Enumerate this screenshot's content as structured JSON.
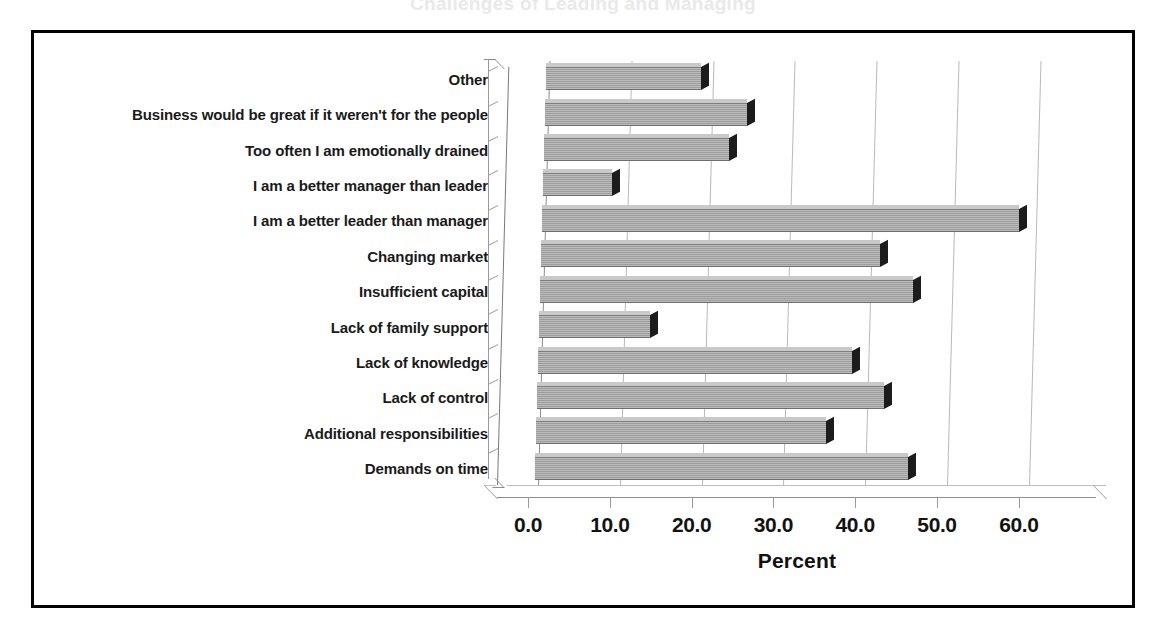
{
  "figure": {
    "frame_border_color": "#000000",
    "background": "#ffffff",
    "title_remnant": "Challenges of Leading and Managing"
  },
  "chart_data": {
    "type": "bar",
    "orientation": "horizontal",
    "title": "",
    "xlabel": "Percent",
    "ylabel": "",
    "xlim": [
      0.0,
      60.0
    ],
    "xticks": [
      "0.0",
      "10.0",
      "20.0",
      "30.0",
      "40.0",
      "50.0",
      "60.0"
    ],
    "xtick_values": [
      0,
      10,
      20,
      30,
      40,
      50,
      60
    ],
    "grid": true,
    "grid_axis": "x",
    "legend": false,
    "bar_color": "#9d9d9d",
    "bar_edge_color": "#1c1c1c",
    "style": "3d-bar",
    "categories": [
      "Other",
      "Business would be great if it weren't for the people",
      "Too often I am emotionally drained",
      "I am a better manager than leader",
      "I am a better leader than manager",
      "Changing market",
      "Insufficient capital",
      "Lack of family support",
      "Lack of knowledge",
      "Lack of control",
      "Additional responsibilities",
      "Demands on time"
    ],
    "values": [
      19.0,
      24.7,
      22.6,
      8.5,
      58.3,
      41.5,
      45.6,
      13.6,
      38.4,
      42.4,
      35.4,
      45.5
    ]
  }
}
